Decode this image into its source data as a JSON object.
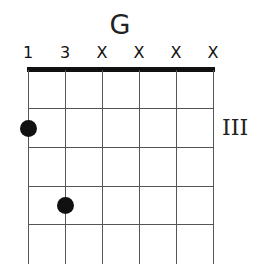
{
  "chord": {
    "name": "G",
    "position_label": "III",
    "string_markers": [
      "1",
      "3",
      "X",
      "X",
      "X",
      "X"
    ],
    "frets_shown": 5,
    "dots": [
      {
        "string": 1,
        "fret_row": 1,
        "finger": "1"
      },
      {
        "string": 2,
        "fret_row": 3,
        "finger": "3"
      }
    ]
  }
}
